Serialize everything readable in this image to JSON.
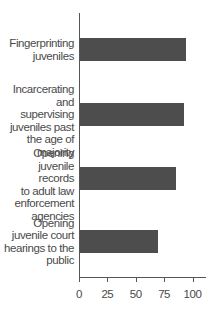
{
  "chart_data": {
    "type": "bar",
    "orientation": "horizontal",
    "title": "",
    "xlabel": "",
    "ylabel": "",
    "categories": [
      "Fingerprinting juveniles",
      "Incarcerating and supervising juveniles past the age of majority",
      "Opening juvenile records to adult law enforcement agencies",
      "Opening juvenile court hearings to the public"
    ],
    "category_lines": [
      [
        "Fingerprinting",
        "juveniles"
      ],
      [
        "Incarcerating",
        "and supervising",
        "juveniles past",
        "the age of",
        "majority"
      ],
      [
        "Opening",
        "juvenile records",
        "to adult law",
        "enforcement",
        "agencies"
      ],
      [
        "Opening",
        "juvenile court",
        "hearings to the",
        "public"
      ]
    ],
    "values": [
      93,
      92,
      85,
      69
    ],
    "xlim": [
      0,
      112
    ],
    "xticks": [
      0,
      25,
      50,
      75,
      100
    ],
    "grid": false,
    "legend": null,
    "bar_color": "#4d4d4d"
  }
}
